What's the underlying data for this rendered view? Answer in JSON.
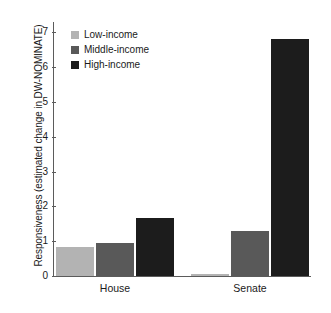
{
  "chart_data": {
    "type": "bar",
    "title": "",
    "xlabel": "",
    "ylabel": "Responsiveness (estimated change in DW-NOMINATE)",
    "categories": [
      "House",
      "Senate"
    ],
    "series": [
      {
        "name": "Low-income",
        "color": "#b3b3b3",
        "values": [
          0.82,
          0.07
        ]
      },
      {
        "name": "Middle-income",
        "color": "#595959",
        "values": [
          0.94,
          1.3
        ]
      },
      {
        "name": "High-income",
        "color": "#1c1c1c",
        "values": [
          1.68,
          6.82
        ]
      }
    ],
    "ylim": [
      0,
      7.3
    ],
    "yticks": [
      0,
      1,
      2,
      3,
      4,
      5,
      6,
      7
    ],
    "ytick_labels": [
      "0",
      "1",
      "2",
      "3",
      "4",
      "5",
      "6",
      "7"
    ],
    "grid": false,
    "legend_position": "top-left",
    "axis_color": "#5b5b5b"
  },
  "legend": {
    "items": [
      {
        "label": "Low-income",
        "swatch": "legend-swatch-low-income"
      },
      {
        "label": "Middle-income",
        "swatch": "legend-swatch-middle-income"
      },
      {
        "label": "High-income",
        "swatch": "legend-swatch-high-income"
      }
    ]
  }
}
